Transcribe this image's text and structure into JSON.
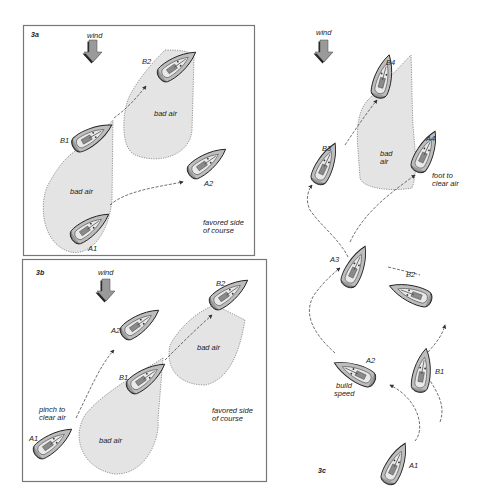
{
  "figure": {
    "panels": [
      {
        "id": "3a",
        "label": "3a",
        "wind_label": "wind",
        "boats": [
          "A1",
          "A2",
          "B1",
          "B2"
        ],
        "zones": [
          "bad air",
          "bad air"
        ],
        "annotations": [
          "favored side",
          "of course"
        ]
      },
      {
        "id": "3b",
        "label": "3b",
        "wind_label": "wind",
        "boats": [
          "A1",
          "A2",
          "B1",
          "B2"
        ],
        "zones": [
          "bad air",
          "bad air"
        ],
        "annotations": [
          "pinch to",
          "clear air",
          "favored side",
          "of course"
        ]
      },
      {
        "id": "3c",
        "label": "3c",
        "wind_label": "wind",
        "boats": [
          "A1",
          "A2",
          "A3",
          "A4",
          "B1",
          "B2",
          "B3",
          "B4"
        ],
        "zones": [
          "bad",
          "air"
        ],
        "annotations": [
          "foot to",
          "clear air",
          "build",
          "speed"
        ]
      }
    ]
  },
  "colors": {
    "hull": "#bdbdbd",
    "bad_air": "#e4e4e4",
    "frame": "#777777",
    "wind_arrow": "#9a9a9a"
  }
}
